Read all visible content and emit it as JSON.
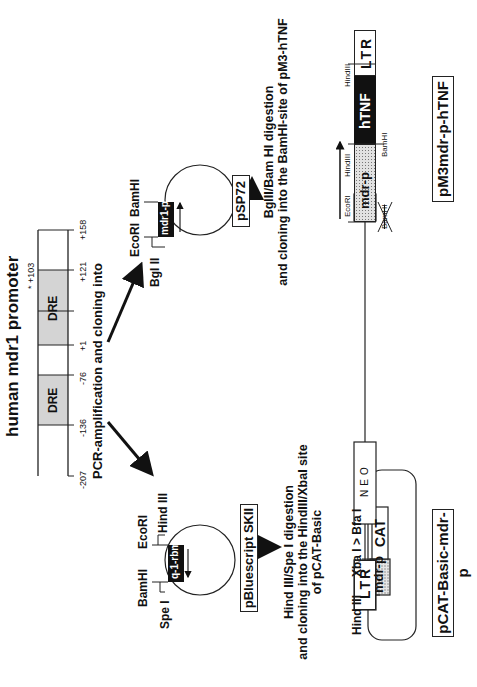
{
  "title": "human mdr1 promoter",
  "promoter": {
    "elements": [
      {
        "label": "DRE",
        "start": "-136",
        "end": "-76"
      },
      {
        "label": "DRE",
        "start": "+1",
        "end": "+121"
      }
    ],
    "positions": [
      "-207",
      "-136",
      "-76",
      "+1",
      "+121",
      "+158"
    ],
    "marker": "* +103",
    "fill_color": "#d4d4d4"
  },
  "step1_caption": "PCR-amplification and cloning into",
  "psp72": {
    "name": "pSP72",
    "insert": "mdr1-p",
    "sites": [
      "Bgl II",
      "EcoRI",
      "BamHI"
    ]
  },
  "pbluescript": {
    "name": "pBluescript SKII",
    "insert": "q-1-rbm",
    "sites": [
      "Spe I",
      "BamHI",
      "EcoRI",
      "Hind III"
    ]
  },
  "step2_left_caption": {
    "line1": "Hind III/Spe I digestion",
    "line2": "and cloning into the HindIII/XbaI site",
    "line3": "of pCAT-Basic"
  },
  "step2_right_caption": {
    "line1": "BglII/Bam HI digestion",
    "line2": "and cloning into the BamHI-site of pM3-hTNF"
  },
  "pcat": {
    "name": "pCAT-Basic-mdr-p",
    "promoter_block": "mdr-p",
    "reporter_block": "CAT",
    "sites": [
      "Hind III",
      "Xba I > Bfa I"
    ]
  },
  "pm3": {
    "name": "pM3mdr-p-hTNF",
    "blocks": [
      "LTR",
      "NEO",
      "mdr-p",
      "hTNF",
      "LTR"
    ],
    "sites": [
      "EcoRI",
      "HindIII",
      "BamHI",
      "BamHI",
      "HindIII"
    ],
    "destroyed_site": "BamHI"
  }
}
